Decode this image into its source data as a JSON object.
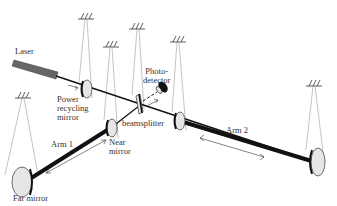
{
  "diagram": {
    "type": "interferometer-schematic",
    "labels": {
      "laser": "Laser",
      "power_recycling_mirror": [
        "Power",
        "recycling",
        "mirror"
      ],
      "photodetector": [
        "Photo-",
        "detector"
      ],
      "beamsplitter": "beamsplitter",
      "near_mirror": [
        "Near",
        "mirror"
      ],
      "arm1": "Arm 1",
      "arm2": "Arm 2",
      "far_mirror": "Far mirror"
    },
    "colors": {
      "beam": "#111111",
      "mirror_fill": "#e6e6e6",
      "laser_fill": "#666666",
      "wire": "#888888"
    }
  }
}
